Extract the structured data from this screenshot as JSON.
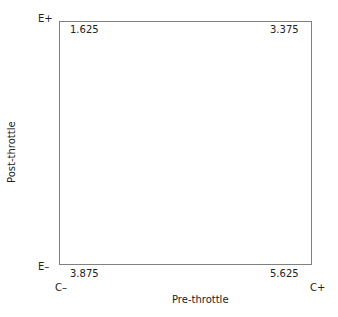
{
  "diagram": {
    "axes": {
      "x_label": "Pre-throttle",
      "y_label": "Post-throttle",
      "x_min_label": "C–",
      "x_max_label": "C+",
      "y_min_label": "E–",
      "y_max_label": "E+"
    },
    "quadrant_values": {
      "top_left": "1.625",
      "top_right": "3.375",
      "bottom_left": "3.875",
      "bottom_right": "5.625"
    }
  }
}
